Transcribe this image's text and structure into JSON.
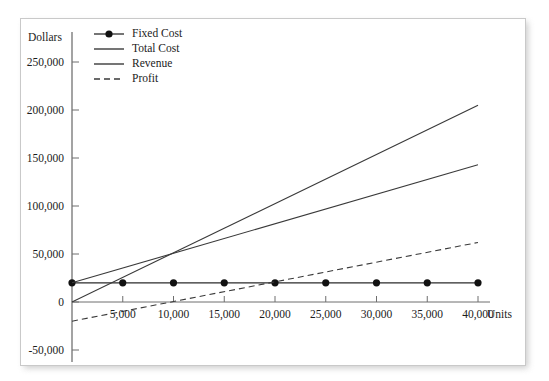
{
  "chart_data": {
    "type": "line",
    "title": "",
    "xlabel": "Units",
    "ylabel": "Dollars",
    "grid": false,
    "legend_position": "top-left",
    "xlim": [
      0,
      40000
    ],
    "ylim": [
      -50000,
      250000
    ],
    "xticks": [
      5000,
      10000,
      15000,
      20000,
      25000,
      30000,
      35000,
      40000
    ],
    "xticklabels": [
      "5,000",
      "10,000",
      "15,000",
      "20,000",
      "25,000",
      "30,000",
      "35,000",
      "40,000"
    ],
    "yticks": [
      -50000,
      0,
      50000,
      100000,
      150000,
      200000,
      250000
    ],
    "yticklabels": [
      "-50,000",
      "0",
      "50,000",
      "100,000",
      "150,000",
      "200,000",
      "250,000"
    ],
    "series": [
      {
        "name": "Fixed Cost",
        "style": "solid-with-markers",
        "color": "#2b2b2b",
        "x": [
          0,
          5000,
          10000,
          15000,
          20000,
          25000,
          30000,
          35000,
          40000
        ],
        "values": [
          20000,
          20000,
          20000,
          20000,
          20000,
          20000,
          20000,
          20000,
          20000
        ]
      },
      {
        "name": "Total Cost",
        "style": "solid",
        "color": "#3a3a3a",
        "x": [
          0,
          40000
        ],
        "values": [
          20000,
          143000
        ]
      },
      {
        "name": "Revenue",
        "style": "solid",
        "color": "#3a3a3a",
        "x": [
          0,
          40000
        ],
        "values": [
          0,
          205000
        ]
      },
      {
        "name": "Profit",
        "style": "dashed",
        "color": "#3a3a3a",
        "x": [
          0,
          40000
        ],
        "values": [
          -20000,
          62000
        ]
      }
    ],
    "annotations": {
      "breakeven_units": 9400,
      "breakeven_dollars": 53000
    }
  },
  "legend": {
    "items": [
      {
        "label": "Fixed Cost",
        "marker": "line-with-dot-icon"
      },
      {
        "label": "Total Cost",
        "marker": "solid-line-icon"
      },
      {
        "label": "Revenue",
        "marker": "solid-line-icon"
      },
      {
        "label": "Profit",
        "marker": "dashed-line-icon"
      }
    ]
  },
  "axes": {
    "y_title": "Dollars",
    "x_title": "Units"
  }
}
